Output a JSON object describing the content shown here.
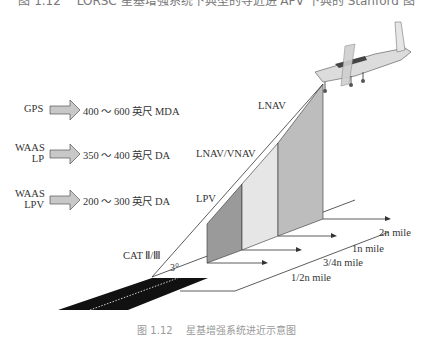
{
  "figure": {
    "title": "图 1.12 　LORSC 星基增强系统下典型的导近进 APV 下典的 Stanford 图",
    "caption": "图 1.12 　星基增强系统进近示意图"
  },
  "minima_legend": [
    {
      "system": "GPS",
      "minima": "400 ～ 600 英尺 MDA"
    },
    {
      "system": "WAAS\nLP",
      "system_line1": "WAAS",
      "system_line2": "LP",
      "minima": "350 ～ 400 英尺 DA"
    },
    {
      "system": "WAAS\nLPV",
      "system_line1": "WAAS",
      "system_line2": "LPV",
      "minima": "200 ～ 300 英尺 DA"
    }
  ],
  "approach_labels": {
    "lnav": "LNAV",
    "lnav_vnav": "LNAV/VNAV",
    "lpv": "LPV",
    "cat": "CAT Ⅱ/Ⅲ",
    "angle": "3°"
  },
  "distance_labels": [
    "1/2n mile",
    "3/4n mile",
    "1n mile",
    "2n mile"
  ],
  "colors": {
    "lpv_wall": "#9a9a9a",
    "lnav_vnav_wall": "#e6e6e6",
    "lnav_wall": "#bdbdbd",
    "arrow_fill": "#c8c8c8",
    "runway": "#111111",
    "line": "#333333"
  }
}
